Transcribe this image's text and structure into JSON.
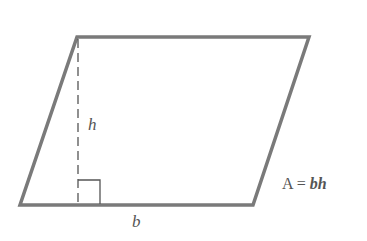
{
  "figure": {
    "shape": "parallelogram",
    "colors": {
      "outline": "#7a7a7a",
      "height_line": "#555555",
      "text": "#555555",
      "background": "#ffffff"
    },
    "vertices": {
      "top_left": [
        77,
        37
      ],
      "top_right": [
        309,
        37
      ],
      "bottom_right": [
        253,
        205
      ],
      "bottom_left": [
        20,
        205
      ]
    }
  },
  "labels": {
    "height": "h",
    "base": "b",
    "formula": "A = bh",
    "formula_parts": {
      "lhs": "A",
      "eq": " = ",
      "rhs": "bh"
    }
  }
}
